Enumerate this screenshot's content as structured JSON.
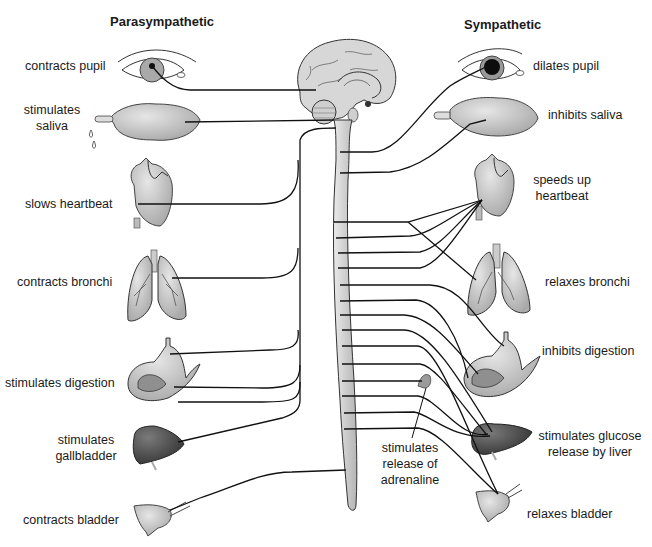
{
  "diagram": {
    "title_left": "Parasympathetic",
    "title_right": "Sympathetic",
    "parasympathetic": [
      {
        "organ": "eye",
        "label": "contracts pupil"
      },
      {
        "organ": "salivary-gland",
        "label_lines": [
          "stimulates",
          "saliva"
        ]
      },
      {
        "organ": "heart",
        "label": "slows heartbeat"
      },
      {
        "organ": "lungs",
        "label": "contracts bronchi"
      },
      {
        "organ": "stomach",
        "label": "stimulates digestion"
      },
      {
        "organ": "liver",
        "label_lines": [
          "stimulates",
          "gallbladder"
        ]
      },
      {
        "organ": "bladder",
        "label": "contracts bladder"
      }
    ],
    "sympathetic": [
      {
        "organ": "eye",
        "label": "dilates pupil"
      },
      {
        "organ": "salivary-gland",
        "label": "inhibits saliva"
      },
      {
        "organ": "heart",
        "label_lines": [
          "speeds up",
          "heartbeat"
        ]
      },
      {
        "organ": "lungs",
        "label": "relaxes bronchi"
      },
      {
        "organ": "stomach",
        "label": "inhibits digestion"
      },
      {
        "organ": "adrenal-gland",
        "label_lines": [
          "stimulates",
          "release of",
          "adrenaline"
        ]
      },
      {
        "organ": "liver",
        "label_lines": [
          "stimulates glucose",
          "release by liver"
        ]
      },
      {
        "organ": "bladder",
        "label": "relaxes bladder"
      }
    ],
    "central": {
      "brain": "brain",
      "spinal_cord": "spinal-cord"
    },
    "colors": {
      "line": "#111111",
      "organ_fill": "#c8c8c8",
      "organ_stroke": "#333333",
      "liver_fill": "#4a4a4a",
      "cord_fill": "#d9d9d9"
    }
  }
}
